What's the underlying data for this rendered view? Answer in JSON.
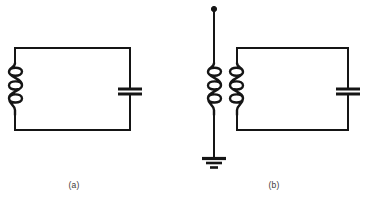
{
  "figure": {
    "background_color": "#ffffff",
    "line_color": "#151515",
    "caption_color": "#3a3a3a",
    "panels": [
      {
        "label": "(a)",
        "name": "panel-a",
        "description": "Parallel LC tank circuit: inductor coil on left, capacitor on right",
        "components": [
          {
            "type": "inductor",
            "name": "inductor-coil-a",
            "turns": 3,
            "position": "left-side"
          },
          {
            "type": "capacitor",
            "name": "capacitor-a",
            "plates": 2,
            "position": "right-side"
          },
          {
            "type": "wire-loop",
            "name": "circuit-loop-a",
            "shape": "rectangle"
          }
        ]
      },
      {
        "label": "(b)",
        "name": "panel-b",
        "description": "Antenna coupled via transformer to a parallel LC tank circuit with ground",
        "components": [
          {
            "type": "antenna-terminal",
            "name": "antenna-terminal-b",
            "marker": "filled-dot",
            "position": "top"
          },
          {
            "type": "inductor",
            "name": "primary-coil-b",
            "turns": 3,
            "position": "antenna-line"
          },
          {
            "type": "inductor",
            "name": "secondary-coil-b",
            "turns": 3,
            "position": "tank-left-side"
          },
          {
            "type": "transformer",
            "name": "transformer-b",
            "coupling": "magnetic",
            "coils": 2
          },
          {
            "type": "capacitor",
            "name": "capacitor-b",
            "plates": 2,
            "position": "right-side"
          },
          {
            "type": "ground",
            "name": "ground-symbol-b",
            "bars": 3,
            "position": "bottom"
          },
          {
            "type": "wire-loop",
            "name": "circuit-loop-b",
            "shape": "rectangle"
          }
        ]
      }
    ]
  }
}
